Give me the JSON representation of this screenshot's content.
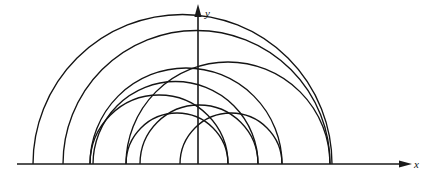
{
  "figure": {
    "type": "geometric-diagram",
    "background_color": "#ffffff",
    "stroke_color": "#141414",
    "axis_color": "#1a1a1a"
  },
  "axes": {
    "x": {
      "label": "x",
      "label_position": {
        "x": 414,
        "y": 168
      },
      "line": {
        "x1": 17,
        "y1": 164,
        "x2": 400,
        "y2": 164
      },
      "arrow": "right",
      "arrow_tip": {
        "x": 404,
        "y": 164
      }
    },
    "y": {
      "label": "y",
      "label_position": {
        "x": 205,
        "y": 17
      },
      "line": {
        "x1": 198,
        "y1": 164,
        "x2": 198,
        "y2": 16
      },
      "arrow": "up",
      "arrow_tip": {
        "x": 198,
        "y": 12
      }
    },
    "origin": {
      "x": 198,
      "y": 164
    }
  },
  "chart_data": {
    "type": "scatter",
    "title": "",
    "xlabel": "x",
    "ylabel": "y",
    "grid": false,
    "legend": null,
    "arcs": [
      {
        "id": "arc-1",
        "left_x": 33,
        "right_x": 332,
        "center_x": 182.5,
        "radius": 149.5,
        "apex_y": 70
      },
      {
        "id": "arc-2",
        "left_x": 63,
        "right_x": 330,
        "center_x": 196.5,
        "radius": 133.5,
        "apex_y": 70
      },
      {
        "id": "arc-3",
        "left_x": 90,
        "right_x": 282,
        "center_x": 186.0,
        "radius": 96.0,
        "apex_y": 70
      },
      {
        "id": "arc-4",
        "left_x": 93,
        "right_x": 258,
        "center_x": 175.5,
        "radius": 82.5,
        "apex_y": 82
      },
      {
        "id": "arc-5",
        "left_x": 126,
        "right_x": 228,
        "center_x": 177.0,
        "radius": 51.0,
        "apex_y": 113
      },
      {
        "id": "arc-6",
        "left_x": 140,
        "right_x": 258,
        "center_x": 199.0,
        "radius": 59.0,
        "apex_y": 105
      },
      {
        "id": "arc-7",
        "left_x": 180,
        "right_x": 282,
        "center_x": 231.0,
        "radius": 51.0,
        "apex_y": 113
      },
      {
        "id": "arc-8",
        "left_x": 90,
        "right_x": 228,
        "center_x": 159.0,
        "radius": 69.0,
        "apex_y": 95
      },
      {
        "id": "arc-9",
        "left_x": 126,
        "right_x": 330,
        "center_x": 228.0,
        "radius": 102.0,
        "apex_y": 62
      }
    ],
    "baseline_contact_points": [
      33,
      63,
      90,
      93,
      126,
      140,
      180,
      198,
      228,
      258,
      282,
      330,
      332
    ],
    "xlim": [
      17,
      404
    ],
    "ylim": [
      0,
      164
    ]
  }
}
